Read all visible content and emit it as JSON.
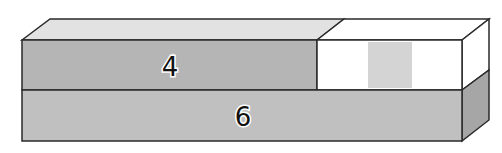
{
  "diagram": {
    "type": "bar-model",
    "top_bar": {
      "known_part": {
        "label": "4",
        "color": "#b5b5b5"
      },
      "unknown_part": {
        "label": "",
        "color": "#ffffff",
        "placeholder_color": "#d4d4d4"
      },
      "top_face_color": "#e2e2e2"
    },
    "bottom_bar": {
      "label": "6",
      "color": "#c0c0c0",
      "side_color": "#a6a6a6"
    },
    "stroke_color": "#2a2a2a"
  }
}
